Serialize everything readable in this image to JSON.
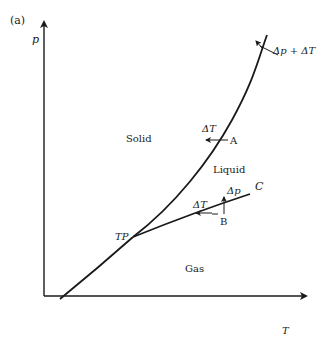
{
  "figure": {
    "panel_label": "(a)",
    "caption_fragment": "",
    "axes": {
      "y_label": "p",
      "x_label": "T"
    },
    "regions": {
      "solid": "Solid",
      "liquid": "Liquid",
      "gas": "Gas"
    },
    "points": {
      "triple_point": "TP",
      "critical_point": "C",
      "point_a": "A",
      "point_b": "B"
    },
    "annotations": {
      "top_right": "Δp + ΔT",
      "a_delta": "ΔT",
      "b_delta_t": "ΔT",
      "b_delta_p": "Δp"
    },
    "colors": {
      "line": "#1a1a1a",
      "background": "#ffffff"
    }
  }
}
